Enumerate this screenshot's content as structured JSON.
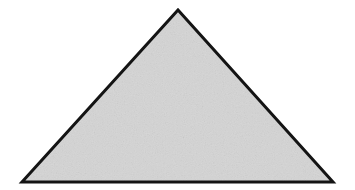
{
  "canvas": {
    "width": 355,
    "height": 190,
    "background_color": "#ffffff"
  },
  "figure": {
    "shape_name": "triangle",
    "shape_kind": "isosceles-triangle",
    "fill_color": "#d7d7d7",
    "stroke_color": "#141414",
    "stroke_width": 3,
    "texture": "fine-grain-noise",
    "vertices": [
      {
        "label": "apex",
        "x": 178,
        "y": 10
      },
      {
        "label": "bottom-right",
        "x": 333,
        "y": 182
      },
      {
        "label": "bottom-left",
        "x": 22,
        "y": 182
      }
    ],
    "points_attr": "178,10 333,182 22,182",
    "base_width": 311,
    "height": 172
  }
}
